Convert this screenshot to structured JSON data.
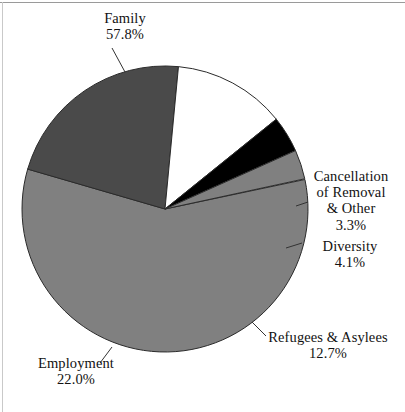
{
  "chart_data": {
    "type": "pie",
    "title": "",
    "subtitle": "",
    "xlabel": "",
    "ylabel": "",
    "legend_position": "none",
    "grid": false,
    "labels_show_percent": true,
    "categories": [
      "Family",
      "Employment",
      "Refugees & Asylees",
      "Diversity",
      "Cancellation of Removal & Other"
    ],
    "values": [
      57.8,
      22.0,
      12.7,
      4.1,
      3.3
    ],
    "units": "percent",
    "slices": [
      {
        "name": "Family",
        "label_lines": [
          "Family",
          "57.8%"
        ],
        "value": 57.8,
        "value_text": "57.8%",
        "color": "#808080",
        "start_angle_deg": 348.1,
        "sweep_deg": 208.1
      },
      {
        "name": "Employment",
        "label_lines": [
          "Employment",
          "22.0%"
        ],
        "value": 22.0,
        "value_text": "22.0%",
        "color": "#4a4a4a",
        "start_angle_deg": 196.2,
        "sweep_deg": 79.2
      },
      {
        "name": "Refugees & Asylees",
        "label_lines": [
          "Refugees & Asylees",
          "12.7%"
        ],
        "value": 12.7,
        "value_text": "12.7%",
        "color": "#ffffff",
        "start_angle_deg": 275.4,
        "sweep_deg": 45.7
      },
      {
        "name": "Diversity",
        "label_lines": [
          "Diversity",
          "4.1%"
        ],
        "value": 4.1,
        "value_text": "4.1%",
        "color": "#000000",
        "start_angle_deg": 321.1,
        "sweep_deg": 14.8
      },
      {
        "name": "Cancellation of Removal & Other",
        "label_lines": [
          "Cancellation",
          "of Removal",
          "& Other",
          "3.3%"
        ],
        "value": 3.3,
        "value_text": "3.3%",
        "color": "#808080",
        "start_angle_deg": 335.9,
        "sweep_deg": 11.9
      }
    ],
    "geometry": {
      "center_x": 165,
      "center_y": 209,
      "radius": 143,
      "outline_color": "#2b2b2b"
    }
  },
  "labels": {
    "family": {
      "line1": "Family",
      "line2": "57.8%"
    },
    "employment": {
      "line1": "Employment",
      "line2": "22.0%"
    },
    "refugees": {
      "line1": "Refugees & Asylees",
      "line2": "12.7%"
    },
    "diversity": {
      "line1": "Diversity",
      "line2": "4.1%"
    },
    "cancellation": {
      "line1": "Cancellation",
      "line2": "of Removal",
      "line3": "& Other",
      "line4": "3.3%"
    }
  }
}
